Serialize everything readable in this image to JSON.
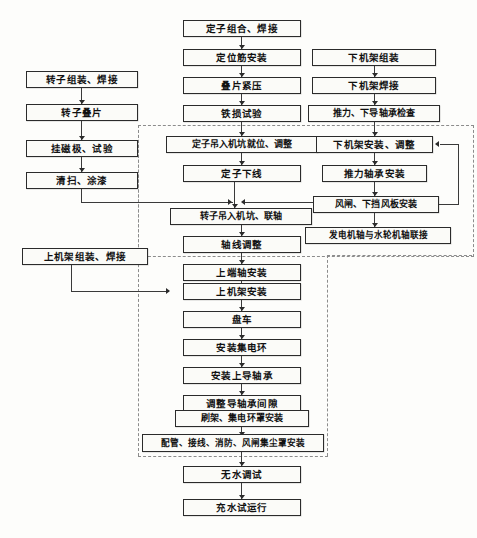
{
  "diagram": {
    "type": "flowchart",
    "orientation": "top-to-bottom",
    "colors": {
      "box_border": "#2b2b2b",
      "box_fill": "#fbfbf8",
      "connector": "#3a3a3a",
      "dashed_group": "#8c8c8c",
      "page_background": "#fdfdfb"
    },
    "columns": {
      "left": "转子 / 上机架 分支",
      "center": "定子主线",
      "right": "下机架 / 轴承 分支"
    },
    "nodes": {
      "rotor_assemble_weld": "转子组装、焊接",
      "rotor_lamination": "转子叠片",
      "hang_magnet_test": "挂磁极、试验",
      "clean_paint": "清扫、涂漆",
      "upper_frame_assemble_weld": "上机架组装、焊接",
      "stator_assemble_weld": "定子组合、焊接",
      "locating_rib_install": "定位筋安装",
      "lamination_press": "叠片紧压",
      "iron_loss_test": "铁损试验",
      "stator_lift_into_pit": "定子吊入机坑就位、调整",
      "stator_winding": "定子下线",
      "rotor_lift_couple": "转子吊入机坑、联轴",
      "shaft_alignment": "轴线调整",
      "upper_shaft_install": "上端轴安装",
      "upper_frame_install": "上机架安装",
      "barring": "盘车",
      "slip_ring_install": "安装集电环",
      "upper_guide_bearing_install": "安装上导轴承",
      "guide_bearing_clearance": "调整导轴承间隙",
      "brush_holder_slipring_cover": "刷架、集电环罩安装",
      "piping_wiring_fire_brake": "配管、接线、消防、风闸集尘罩安装",
      "dry_commissioning": "无水调试",
      "water_filled_trial": "充水试运行",
      "lower_frame_assemble": "下机架组装",
      "lower_frame_weld": "下机架焊接",
      "thrust_lower_guide_check": "推力、下导轴承检查",
      "lower_frame_install_adjust": "下机架安装、调整",
      "thrust_bearing_install": "推力轴承安装",
      "brake_lower_baffle_install": "风闸、下挡风板安装",
      "generator_turbine_shaft_couple": "发电机轴与水轮机轴联接"
    }
  }
}
